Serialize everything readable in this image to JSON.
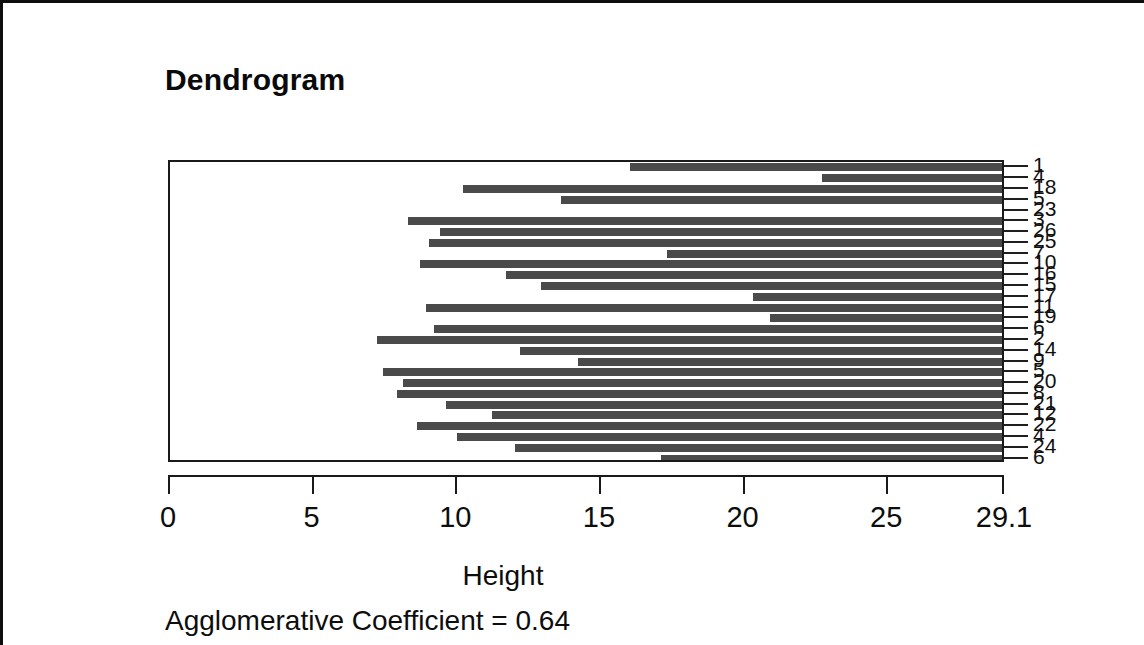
{
  "figure": {
    "title": "Dendrogram",
    "caption": "Agglomerative Coefficient =  0.64",
    "background": "#ffffff",
    "bar_color": "#4a4a4a",
    "axis_color": "#1a1a1a"
  },
  "chart_data": {
    "type": "bar",
    "subtype": "banner-plot",
    "title": "Dendrogram",
    "xlabel": "Height",
    "ylabel": "",
    "xlim": [
      0,
      29.1
    ],
    "grid": false,
    "legend": null,
    "annotation": "Agglomerative Coefficient =  0.64",
    "agglomerative_coefficient": 0.64,
    "xticks": [
      0,
      5,
      10,
      15,
      20,
      25,
      29.1
    ],
    "xticklabels": [
      "0",
      "5",
      "10",
      "15",
      "20",
      "25",
      "29.1"
    ],
    "orientation": "horizontal",
    "bar_extends_to": 29.1,
    "categories": [
      "1",
      "4",
      "18",
      "5",
      "23",
      "3",
      "26",
      "25",
      "7",
      "10",
      "16",
      "15",
      "17",
      "11",
      "19",
      "6",
      "2",
      "14",
      "9",
      "5b",
      "20",
      "8b",
      "21",
      "12",
      "22",
      "4b",
      "24",
      "6b"
    ],
    "leaf_labels": [
      "1",
      "4",
      "18",
      "5",
      "23",
      "3",
      "26",
      "25",
      "7",
      "10",
      "16",
      "15",
      "17",
      "11",
      "19",
      "6",
      "2",
      "14",
      "9",
      "5",
      "20",
      "8",
      "21",
      "12",
      "22",
      "4",
      "24",
      "6"
    ],
    "merge_heights": [
      16.0,
      22.7,
      10.2,
      13.6,
      29.1,
      8.3,
      9.4,
      9.0,
      17.3,
      8.7,
      11.7,
      12.9,
      20.3,
      8.9,
      20.9,
      9.2,
      7.2,
      12.2,
      14.2,
      7.4,
      8.1,
      7.9,
      9.6,
      11.2,
      8.6,
      10.0,
      12.0,
      17.1
    ],
    "values": [
      16.0,
      22.7,
      10.2,
      13.6,
      29.1,
      8.3,
      9.4,
      9.0,
      17.3,
      8.7,
      11.7,
      12.9,
      20.3,
      8.9,
      20.9,
      9.2,
      7.2,
      12.2,
      14.2,
      7.4,
      8.1,
      7.9,
      9.6,
      11.2,
      8.6,
      10.0,
      12.0,
      17.1
    ],
    "note": "Each horizontal bar spans from its merge height to the maximum height 29.1"
  }
}
